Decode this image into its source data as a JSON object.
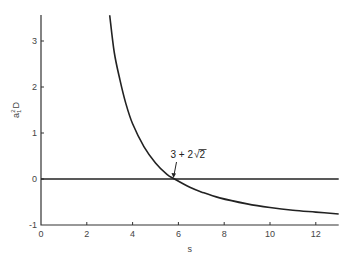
{
  "chart_data": {
    "type": "line",
    "title": "",
    "xlabel": "s",
    "ylabel": "a₁²D",
    "xlim": [
      0,
      13
    ],
    "ylim": [
      -1,
      3.6
    ],
    "xticks": [
      0,
      2,
      4,
      6,
      8,
      10,
      12
    ],
    "yticks": [
      -1,
      0,
      1,
      2,
      3
    ],
    "grid": false,
    "legend": null,
    "series": [
      {
        "name": "a1^2 D",
        "x": [
          3.0,
          3.2,
          3.45,
          3.7,
          4.0,
          4.5,
          5.0,
          5.5,
          5.83,
          6.5,
          7.0,
          7.8,
          9.0,
          10.0,
          11.0,
          12.0,
          13.0
        ],
        "y": [
          3.56,
          2.75,
          2.15,
          1.65,
          1.2,
          0.7,
          0.35,
          0.1,
          0.0,
          -0.18,
          -0.28,
          -0.41,
          -0.54,
          -0.62,
          -0.68,
          -0.72,
          -0.76
        ]
      },
      {
        "name": "zero line",
        "x": [
          0,
          13
        ],
        "y": [
          0,
          0
        ]
      }
    ],
    "annotations": [
      {
        "text": "3 + 2√2",
        "x": 5.83,
        "y": 0,
        "arrow": true
      }
    ]
  },
  "labels": {
    "xlabel": "s",
    "ylabel_base": "a",
    "ylabel_sub": "1",
    "ylabel_sup": "2",
    "ylabel_tail": "D",
    "annotation_prefix": "3 + 2",
    "annotation_radicand": "2"
  }
}
